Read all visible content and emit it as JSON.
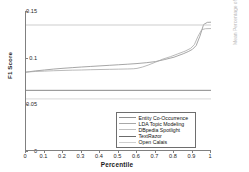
{
  "chart_data": {
    "type": "line",
    "title": "",
    "xlabel": "Percentile",
    "ylabel": "F1 Score",
    "xlim": [
      0,
      1
    ],
    "ylim": [
      0,
      0.15
    ],
    "xticks": [
      "0",
      "0.1",
      "0.2",
      "0.3",
      "0.4",
      "0.5",
      "0.6",
      "0.7",
      "0.8",
      "0.9",
      "1"
    ],
    "yticks": [
      "0",
      "0.05",
      "0.1",
      "0.15"
    ],
    "grid": false,
    "legend_position": "lower right",
    "series": [
      {
        "name": "Entity Co-Occurrence",
        "color": "#8f8f8f",
        "kind": "curve",
        "x": [
          0.0,
          0.02,
          0.05,
          0.1,
          0.15,
          0.2,
          0.25,
          0.3,
          0.35,
          0.4,
          0.45,
          0.5,
          0.55,
          0.6,
          0.65,
          0.7,
          0.75,
          0.8,
          0.85,
          0.88,
          0.9,
          0.92,
          0.94,
          0.96,
          0.98,
          1.0
        ],
        "values": [
          0.0845,
          0.085,
          0.0858,
          0.0868,
          0.0878,
          0.0886,
          0.0893,
          0.09,
          0.0906,
          0.0912,
          0.0918,
          0.0924,
          0.093,
          0.0937,
          0.0946,
          0.0958,
          0.098,
          0.1005,
          0.1042,
          0.1068,
          0.109,
          0.113,
          0.123,
          0.1355,
          0.1378,
          0.138
        ]
      },
      {
        "name": "LDA Topic Modeling",
        "color": "#a8a8a8",
        "kind": "curve",
        "x": [
          0.0,
          0.02,
          0.05,
          0.1,
          0.15,
          0.2,
          0.25,
          0.3,
          0.35,
          0.4,
          0.45,
          0.5,
          0.55,
          0.58,
          0.6,
          0.63,
          0.66,
          0.7,
          0.74,
          0.78,
          0.82,
          0.86,
          0.89,
          0.91,
          0.93,
          0.95,
          0.97,
          1.0
        ],
        "values": [
          0.0845,
          0.0848,
          0.0852,
          0.0856,
          0.086,
          0.0863,
          0.0866,
          0.0868,
          0.0871,
          0.0873,
          0.0875,
          0.0877,
          0.0879,
          0.0881,
          0.0885,
          0.09,
          0.092,
          0.0952,
          0.0985,
          0.101,
          0.104,
          0.107,
          0.11,
          0.114,
          0.123,
          0.13,
          0.131,
          0.1312
        ]
      },
      {
        "name": "DBpedia Spotlight",
        "color": "#c0c0c0",
        "kind": "hline",
        "value": 0.135
      },
      {
        "name": "TextRazor",
        "color": "#6b6b6b",
        "kind": "hline",
        "value": 0.065
      },
      {
        "name": "Open Calais",
        "color": "#cfcfcf",
        "kind": "hline",
        "value": 0.0558
      }
    ]
  },
  "axes": {
    "ylabel": "F1 Score",
    "xlabel": "Percentile"
  },
  "side_fragment": {
    "text": "Mean Percentage of Reach"
  }
}
